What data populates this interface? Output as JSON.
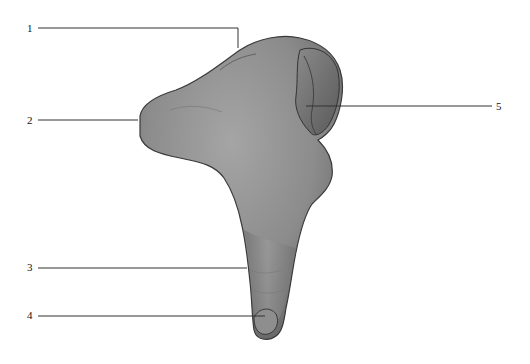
{
  "figure": {
    "colors": {
      "background": "#ffffff",
      "bone_fill_light": "#9a9a9a",
      "bone_fill_dark": "#5e5e5e",
      "bone_outline": "#3a3a3a",
      "leader_line": "#333333",
      "label_text": "#111111"
    }
  },
  "labels": [
    {
      "id": "1",
      "text": "1",
      "x": 27,
      "y": 23
    },
    {
      "id": "2",
      "text": "2",
      "x": 27,
      "y": 115
    },
    {
      "id": "3",
      "text": "3",
      "x": 27,
      "y": 262
    },
    {
      "id": "4",
      "text": "4",
      "x": 27,
      "y": 310
    },
    {
      "id": "5",
      "text": "5",
      "x": 496,
      "y": 101
    }
  ]
}
